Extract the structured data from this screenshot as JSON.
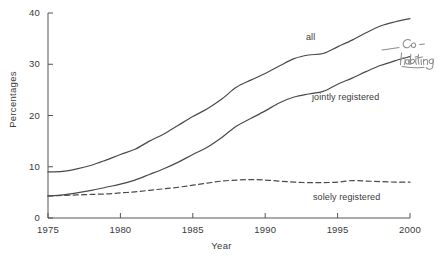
{
  "chart_data": {
    "type": "line",
    "title": "",
    "xlabel": "Year",
    "ylabel": "Percentages",
    "xlim": [
      1975,
      2000
    ],
    "ylim": [
      0,
      40
    ],
    "grid": false,
    "legend_position": "inline-annotations",
    "x_ticks": [
      "1975",
      "1980",
      "1985",
      "1990",
      "1995",
      "2000"
    ],
    "y_ticks": [
      "0",
      "10",
      "20",
      "30",
      "40"
    ],
    "x": [
      1975,
      1976,
      1977,
      1978,
      1979,
      1980,
      1981,
      1982,
      1983,
      1984,
      1985,
      1986,
      1987,
      1988,
      1989,
      1990,
      1991,
      1992,
      1993,
      1994,
      1995,
      1996,
      1997,
      1998,
      1999,
      2000
    ],
    "series": [
      {
        "name": "all",
        "style": "solid",
        "values": [
          9.0,
          9.1,
          9.6,
          10.3,
          11.3,
          12.4,
          13.4,
          15.0,
          16.4,
          18.1,
          19.8,
          21.3,
          23.2,
          25.5,
          26.9,
          28.2,
          29.7,
          31.1,
          31.8,
          32.1,
          33.4,
          34.7,
          36.2,
          37.5,
          38.3,
          38.9
        ]
      },
      {
        "name": "jointly registered",
        "style": "solid",
        "values": [
          4.3,
          4.5,
          4.9,
          5.4,
          6.0,
          6.6,
          7.4,
          8.5,
          9.6,
          10.9,
          12.4,
          13.8,
          15.7,
          17.9,
          19.4,
          20.9,
          22.5,
          23.6,
          24.2,
          24.7,
          26.1,
          27.3,
          28.6,
          29.8,
          30.7,
          31.5
        ]
      },
      {
        "name": "solely registered",
        "style": "dashed",
        "values": [
          4.3,
          4.4,
          4.5,
          4.6,
          4.7,
          4.9,
          5.1,
          5.4,
          5.7,
          6.0,
          6.4,
          6.8,
          7.2,
          7.4,
          7.5,
          7.4,
          7.2,
          7.0,
          6.9,
          6.9,
          7.0,
          7.3,
          7.2,
          7.1,
          7.0,
          7.0
        ]
      }
    ],
    "annotations": [
      {
        "name": "all",
        "text": "all",
        "kind": "series-label"
      },
      {
        "name": "jointly registered",
        "text": "jointly registered",
        "kind": "series-label"
      },
      {
        "name": "solely registered",
        "text": "solely registered",
        "kind": "series-label"
      },
      {
        "name": "handwritten-note",
        "text": "co-habiting",
        "kind": "handwritten-pencil-annotation"
      }
    ]
  },
  "axes": {
    "y_title": "Percentages",
    "x_title": "Year",
    "y_ticks": [
      "40",
      "30",
      "20",
      "10",
      "0"
    ],
    "x_ticks": [
      "1975",
      "1980",
      "1985",
      "1990",
      "1995",
      "2000"
    ]
  },
  "labels": {
    "all": "all",
    "jointly": "jointly registered",
    "solely": "solely registered",
    "handwritten": "co-habiting"
  },
  "colors": {
    "line": "#4a4a4a",
    "axis": "#555555",
    "text": "#3a3a3a",
    "pencil": "#8c8c8c",
    "background": "#ffffff"
  }
}
